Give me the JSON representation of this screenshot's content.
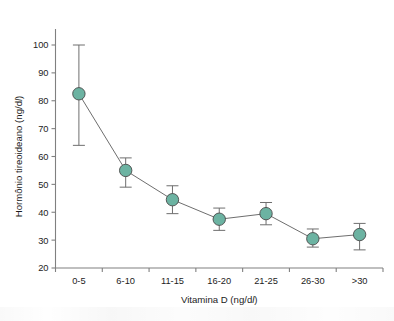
{
  "chart_data": {
    "type": "line",
    "title": "",
    "subtitle": "",
    "xlabel": "Vitamina D (ng/dl)",
    "xlabel_prefix": "Vitamina D (ng/d",
    "xlabel_unit_italic": "l",
    "xlabel_suffix": ")",
    "ylabel": "Hormônio tireoideano (ng/dl)",
    "ylabel_prefix": "Hormônio tireoideano (ng/d",
    "ylabel_unit_italic": "l",
    "ylabel_suffix": ")",
    "categories": [
      "0-5",
      "6-10",
      "11-15",
      "16-20",
      "21-25",
      "26-30",
      ">30"
    ],
    "values": [
      82.5,
      55.0,
      44.5,
      37.5,
      39.5,
      30.5,
      32.0
    ],
    "error_upper": [
      100.0,
      59.5,
      49.5,
      41.5,
      43.5,
      34.0,
      36.0
    ],
    "error_lower": [
      64.0,
      49.0,
      39.5,
      33.5,
      35.5,
      27.5,
      26.5
    ],
    "ylim": [
      20,
      104
    ],
    "yticks": [
      20,
      30,
      40,
      50,
      60,
      70,
      80,
      90,
      100
    ],
    "ytick_labels": [
      "20",
      "30",
      "40",
      "50",
      "60",
      "70",
      "80",
      "90",
      "100"
    ],
    "xtick_labels": [
      "0-5",
      "6-10",
      "11-15",
      "16-20",
      "21-25",
      "26-30",
      ">30"
    ],
    "grid": false,
    "legend": false,
    "legend_position": "none",
    "marker": "circle",
    "marker_color": "#6cb3a2",
    "marker_edge_color": "#4a4a4a",
    "line_color": "#6e6e6e",
    "error_bar_color": "#6e6e6e",
    "axis_color": "#808080",
    "background_color": "#ffffff"
  }
}
